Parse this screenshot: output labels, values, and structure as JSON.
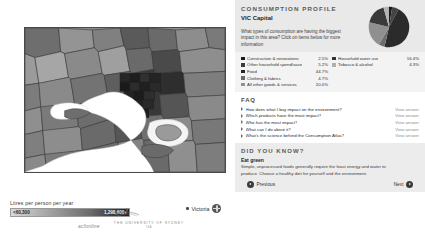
{
  "map": {
    "legend_title": "Litres per person per year",
    "scale_min": "<60,300",
    "scale_max": "1,298,600+",
    "region_control_label": "Victoria",
    "globe_icon": "globe-icon"
  },
  "profile": {
    "title": "CONSUMPTION PROFILE",
    "subtitle": "VIC Capital",
    "question": "What types of consumption are having the biggest impact in this area? Click on items below for more information"
  },
  "chart_data": {
    "type": "pie",
    "legend_position": "below",
    "categories": [
      "Construction & renovations",
      "Other household spend/save",
      "Food",
      "Clothing & fabrics",
      "All other goods & services",
      "Household water use",
      "Tobacco & alcohol"
    ],
    "values": [
      2.5,
      5.2,
      44.7,
      4.7,
      20.0,
      16.4,
      4.3
    ],
    "labels": [
      "2.5%",
      "5.2%",
      "44.7%",
      "4.7%",
      "20.0%",
      "16.4%",
      "4.3%"
    ],
    "colors": [
      "#1a1a1a",
      "#444444",
      "#2b2b2b",
      "#6d6d6d",
      "#8f8f8f",
      "#3a3a3a",
      "#b4b4b4"
    ]
  },
  "legend": {
    "left": [
      {
        "name": "Construction & renovations",
        "pct": "2.5%",
        "color": "#1a1a1a"
      },
      {
        "name": "Other household spend/save",
        "pct": "5.2%",
        "color": "#3c3c3c"
      },
      {
        "name": "Food",
        "pct": "44.7%",
        "color": "#262626"
      },
      {
        "name": "Clothing & fabrics",
        "pct": "4.7%",
        "color": "#6d6d6d"
      },
      {
        "name": "All other goods & services",
        "pct": "20.0%",
        "color": "#909090"
      }
    ],
    "right": [
      {
        "name": "Household water use",
        "pct": "16.4%",
        "color": "#333333"
      },
      {
        "name": "Tobacco & alcohol",
        "pct": "4.3%",
        "color": "#b0b0b0"
      }
    ]
  },
  "faq": {
    "title": "FAQ",
    "link_label": "View answer",
    "items": [
      "How does what I buy impact on the environment?",
      "Which products have the most impact?",
      "Who has the most impact?",
      "What can I do about it?",
      "What's the science behind the Consumption Atlas?"
    ]
  },
  "did_you_know": {
    "title": "DID YOU KNOW?",
    "heading": "Eat green",
    "body": "Simple, unprocessed foods generally require the least energy and water to produce. Choose a healthy diet for yourself and the environment."
  },
  "navigation": {
    "previous": "Previous",
    "next": "Next"
  },
  "logos": {
    "logo1": "acfonline",
    "logo2": "THE UNIVERSITY OF SYDNEY",
    "logo2_sub": "ISA"
  }
}
